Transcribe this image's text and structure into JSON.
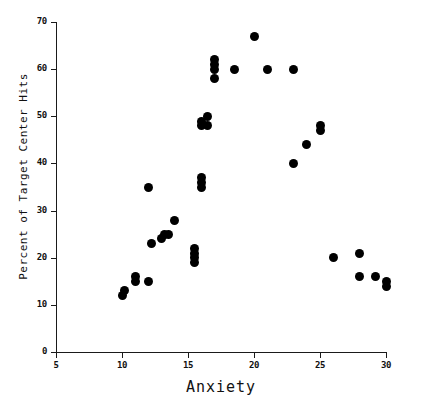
{
  "chart_data": {
    "type": "scatter",
    "title": "",
    "xlabel": "Anxiety",
    "ylabel": "Percent of Target Center Hits",
    "xlim": [
      5,
      30
    ],
    "ylim": [
      0,
      70
    ],
    "xticks": [
      5,
      10,
      15,
      20,
      25,
      30
    ],
    "yticks": [
      0,
      10,
      20,
      30,
      40,
      50,
      60,
      70
    ],
    "grid": false,
    "legend": false,
    "marker": "filled-circle",
    "marker_color": "#000000",
    "n_points": 40,
    "points": [
      {
        "x": 10.0,
        "y": 12
      },
      {
        "x": 10.2,
        "y": 13
      },
      {
        "x": 11.0,
        "y": 16
      },
      {
        "x": 11.0,
        "y": 15
      },
      {
        "x": 12.0,
        "y": 15
      },
      {
        "x": 12.0,
        "y": 35
      },
      {
        "x": 12.2,
        "y": 23
      },
      {
        "x": 13.0,
        "y": 24
      },
      {
        "x": 13.2,
        "y": 25
      },
      {
        "x": 13.5,
        "y": 25
      },
      {
        "x": 14.0,
        "y": 28
      },
      {
        "x": 15.5,
        "y": 19
      },
      {
        "x": 15.5,
        "y": 20
      },
      {
        "x": 15.5,
        "y": 21
      },
      {
        "x": 15.5,
        "y": 22
      },
      {
        "x": 16.0,
        "y": 35
      },
      {
        "x": 16.0,
        "y": 36
      },
      {
        "x": 16.0,
        "y": 37
      },
      {
        "x": 16.0,
        "y": 48
      },
      {
        "x": 16.0,
        "y": 49
      },
      {
        "x": 16.5,
        "y": 50
      },
      {
        "x": 16.5,
        "y": 48
      },
      {
        "x": 17.0,
        "y": 58
      },
      {
        "x": 17.0,
        "y": 60
      },
      {
        "x": 17.0,
        "y": 61
      },
      {
        "x": 17.0,
        "y": 62
      },
      {
        "x": 18.5,
        "y": 60
      },
      {
        "x": 20.0,
        "y": 67
      },
      {
        "x": 21.0,
        "y": 60
      },
      {
        "x": 23.0,
        "y": 60
      },
      {
        "x": 23.0,
        "y": 40
      },
      {
        "x": 24.0,
        "y": 44
      },
      {
        "x": 25.0,
        "y": 47
      },
      {
        "x": 25.0,
        "y": 48
      },
      {
        "x": 26.0,
        "y": 20
      },
      {
        "x": 28.0,
        "y": 21
      },
      {
        "x": 28.0,
        "y": 16
      },
      {
        "x": 29.2,
        "y": 16
      },
      {
        "x": 30.0,
        "y": 14
      },
      {
        "x": 30.0,
        "y": 15
      }
    ]
  }
}
